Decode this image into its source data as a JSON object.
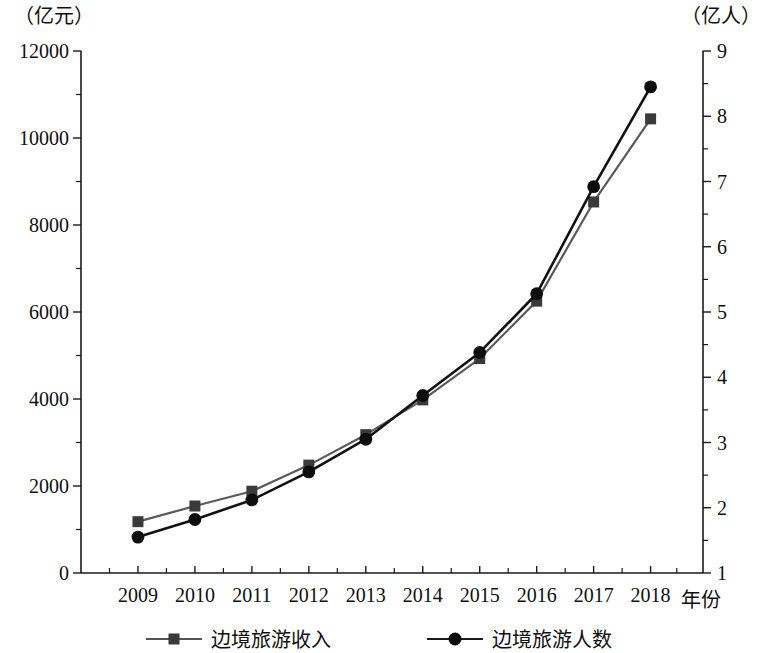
{
  "chart_data": {
    "type": "line",
    "title": "",
    "xlabel": "年份",
    "categories": [
      "2009",
      "2010",
      "2011",
      "2012",
      "2013",
      "2014",
      "2015",
      "2016",
      "2017",
      "2018"
    ],
    "left_axis": {
      "unit_label": "（亿元）",
      "ylim": [
        0,
        12000
      ],
      "major_ticks": [
        0,
        2000,
        4000,
        6000,
        8000,
        10000,
        12000
      ],
      "tick_labels": [
        "0",
        "2000",
        "4000",
        "6000",
        "8000",
        "10000",
        "12000"
      ],
      "minor_tick_step": 1000
    },
    "right_axis": {
      "unit_label": "（亿人）",
      "ylim": [
        1,
        9
      ],
      "major_ticks": [
        1,
        2,
        3,
        4,
        5,
        6,
        7,
        8,
        9
      ],
      "tick_labels": [
        "1",
        "2",
        "3",
        "4",
        "5",
        "6",
        "7",
        "8",
        "9"
      ],
      "minor_tick_step": 0.5
    },
    "grid": false,
    "legend_position": "bottom",
    "series": [
      {
        "name": "边境旅游收入",
        "axis": "left",
        "marker": "square",
        "color": "#3a3a3a",
        "line_color": "#5a5a5a",
        "values": [
          1180,
          1540,
          1880,
          2480,
          3180,
          3980,
          4930,
          6250,
          8530,
          10440
        ]
      },
      {
        "name": "边境旅游人数",
        "axis": "right",
        "marker": "circle",
        "color": "#0d0d0d",
        "line_color": "#111111",
        "values": [
          1.55,
          1.82,
          2.12,
          2.55,
          3.05,
          3.72,
          4.38,
          5.28,
          6.92,
          8.45
        ]
      }
    ]
  },
  "legend": {
    "items": [
      {
        "label": "边境旅游收入",
        "marker": "square-marker"
      },
      {
        "label": "边境旅游人数",
        "marker": "circle-marker"
      }
    ]
  }
}
